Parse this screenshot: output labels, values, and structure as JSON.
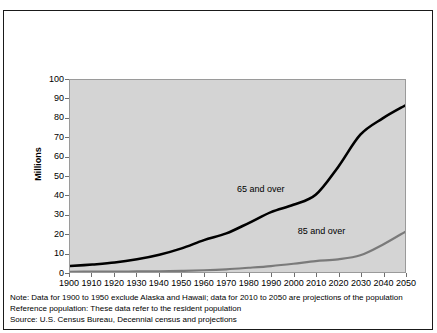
{
  "chart_data": {
    "type": "line",
    "title": "",
    "xlabel": "",
    "ylabel": "Millions",
    "xlim": [
      1900,
      2050
    ],
    "ylim": [
      0,
      100
    ],
    "grid": false,
    "legend_position": "inline-annotation",
    "x": [
      1900,
      1910,
      1920,
      1930,
      1940,
      1950,
      1960,
      1970,
      1980,
      1990,
      2000,
      2010,
      2020,
      2030,
      2040,
      2050
    ],
    "categories": [
      "1900",
      "1910",
      "1920",
      "1930",
      "1940",
      "1950",
      "1960",
      "1970",
      "1980",
      "1990",
      "2000",
      "2010",
      "2020",
      "2030",
      "2040",
      "2050"
    ],
    "ytick_labels": [
      "0",
      "10",
      "20",
      "30",
      "40",
      "50",
      "60",
      "70",
      "80",
      "90",
      "100"
    ],
    "ytick_values": [
      0,
      10,
      20,
      30,
      40,
      50,
      60,
      70,
      80,
      90,
      100
    ],
    "series": [
      {
        "name": "65 and over",
        "color": "#000000",
        "values": [
          3.1,
          3.9,
          4.9,
          6.6,
          9.0,
          12.3,
          16.6,
          20.1,
          25.5,
          31.2,
          35.0,
          40.2,
          54.6,
          71.5,
          80.0,
          86.7
        ]
      },
      {
        "name": "85 and over",
        "color": "#7a7a7a",
        "values": [
          0.1,
          0.2,
          0.2,
          0.3,
          0.4,
          0.6,
          0.9,
          1.4,
          2.2,
          3.1,
          4.3,
          5.7,
          6.6,
          8.7,
          14.2,
          20.9
        ]
      }
    ],
    "annotations": [
      {
        "text": "65 and over",
        "x": 1985,
        "y": 44
      },
      {
        "text": "85 and over",
        "x": 2012,
        "y": 22
      }
    ]
  },
  "axis": {
    "y_title": "Millions"
  },
  "footnotes": {
    "note": "Note: Data for 1900 to 1950 exclude Alaska and Hawaii; data for 2010 to 2050 are projections of the population",
    "reference_population": "Reference population: These data refer to the resident population",
    "source": "Source: U.S. Census Bureau, Decennial census and projections"
  },
  "colors": {
    "plot_background": "#d4d4d4",
    "figure_background": "#ffffff",
    "border": "#1a1a1a",
    "series_65": "#000000",
    "series_85": "#7a7a7a"
  }
}
